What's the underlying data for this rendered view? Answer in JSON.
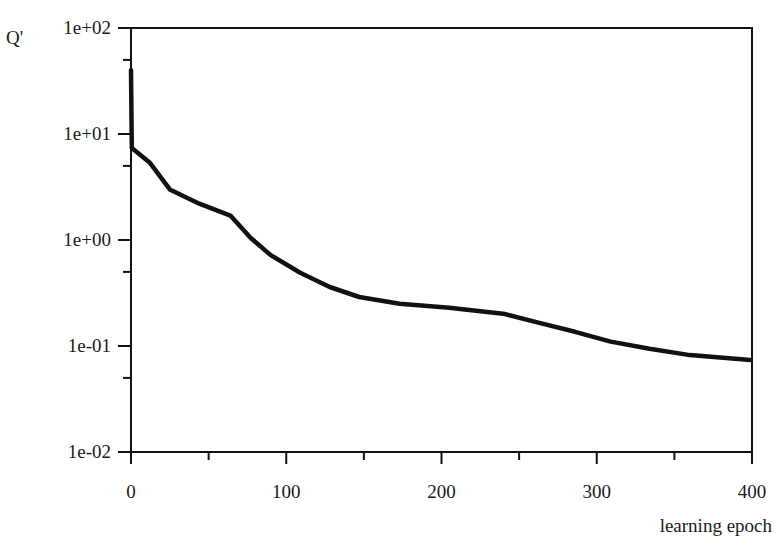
{
  "chart_data": {
    "type": "line",
    "title": "",
    "xlabel": "learning epoch",
    "ylabel": "Q'",
    "yscale": "log",
    "xlim": [
      0,
      400
    ],
    "ylim": [
      0.01,
      100
    ],
    "grid": false,
    "legend": null,
    "x_ticks": [
      0,
      100,
      200,
      300,
      400
    ],
    "x_tick_labels": [
      "0",
      "100",
      "200",
      "300",
      "400"
    ],
    "y_ticks": [
      100,
      10,
      1,
      0.1,
      0.01
    ],
    "y_tick_labels": [
      "1e+02",
      "1e+01",
      "1e+00",
      "1e-01",
      "1e-02"
    ],
    "series": [
      {
        "name": "Q'",
        "color": "#111111",
        "x": [
          0,
          0.5,
          12,
          25,
          44,
          64,
          77,
          90,
          109,
          128,
          147,
          173,
          205,
          241,
          263,
          286,
          309,
          334,
          360,
          399
        ],
        "y": [
          40,
          7.4,
          5.4,
          3.0,
          2.2,
          1.7,
          1.05,
          0.72,
          0.49,
          0.36,
          0.29,
          0.25,
          0.23,
          0.2,
          0.165,
          0.136,
          0.11,
          0.094,
          0.082,
          0.074
        ]
      }
    ]
  },
  "plot_area": {
    "left": 131,
    "top": 28,
    "right": 752,
    "bottom": 452
  }
}
